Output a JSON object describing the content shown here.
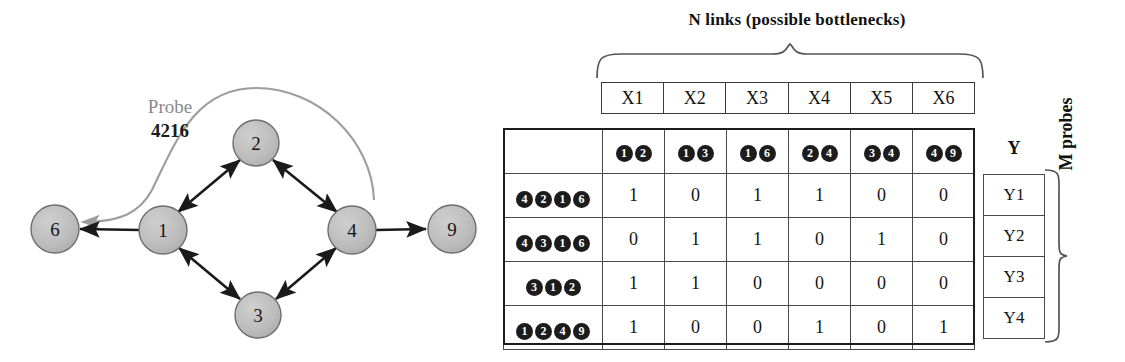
{
  "graph": {
    "probe_label": "Probe",
    "probe_id": "4216",
    "nodes": [
      {
        "id": "6",
        "cx": 55,
        "cy": 229
      },
      {
        "id": "1",
        "cx": 163,
        "cy": 230
      },
      {
        "id": "2",
        "cx": 256,
        "cy": 143
      },
      {
        "id": "3",
        "cx": 258,
        "cy": 315
      },
      {
        "id": "4",
        "cx": 352,
        "cy": 230
      },
      {
        "id": "9",
        "cx": 452,
        "cy": 229
      }
    ],
    "edges": [
      {
        "from": "1",
        "to": "6",
        "style": "arrow-single"
      },
      {
        "from": "1",
        "to": "2",
        "style": "arrow-double"
      },
      {
        "from": "2",
        "to": "4",
        "style": "arrow-double"
      },
      {
        "from": "1",
        "to": "3",
        "style": "arrow-double"
      },
      {
        "from": "3",
        "to": "4",
        "style": "arrow-double"
      },
      {
        "from": "4",
        "to": "9",
        "style": "arrow-single"
      }
    ],
    "probe_path": {
      "from": "4",
      "via": "2",
      "to": "6",
      "color": "#999999"
    },
    "node_fill": "#bcbcbc",
    "node_stroke": "#6e6e6e",
    "edge_color": "#1a1a1a"
  },
  "matrix": {
    "links_title": "N links (possible bottlenecks)",
    "x_headers": [
      "X1",
      "X2",
      "X3",
      "X4",
      "X5",
      "X6"
    ],
    "column_links": [
      [
        "1",
        "2"
      ],
      [
        "1",
        "3"
      ],
      [
        "1",
        "6"
      ],
      [
        "2",
        "4"
      ],
      [
        "3",
        "4"
      ],
      [
        "4",
        "9"
      ]
    ],
    "row_paths": [
      [
        "4",
        "2",
        "1",
        "6"
      ],
      [
        "4",
        "3",
        "1",
        "6"
      ],
      [
        "3",
        "1",
        "2"
      ],
      [
        "1",
        "2",
        "4",
        "9"
      ]
    ],
    "rows": [
      [
        "1",
        "0",
        "1",
        "1",
        "0",
        "0"
      ],
      [
        "0",
        "1",
        "1",
        "0",
        "1",
        "0"
      ],
      [
        "1",
        "1",
        "0",
        "0",
        "0",
        "0"
      ],
      [
        "1",
        "0",
        "0",
        "1",
        "0",
        "1"
      ]
    ],
    "y_title": "Y",
    "y_values": [
      "Y1",
      "Y2",
      "Y3",
      "Y4"
    ],
    "m_probes_label": "M probes"
  }
}
